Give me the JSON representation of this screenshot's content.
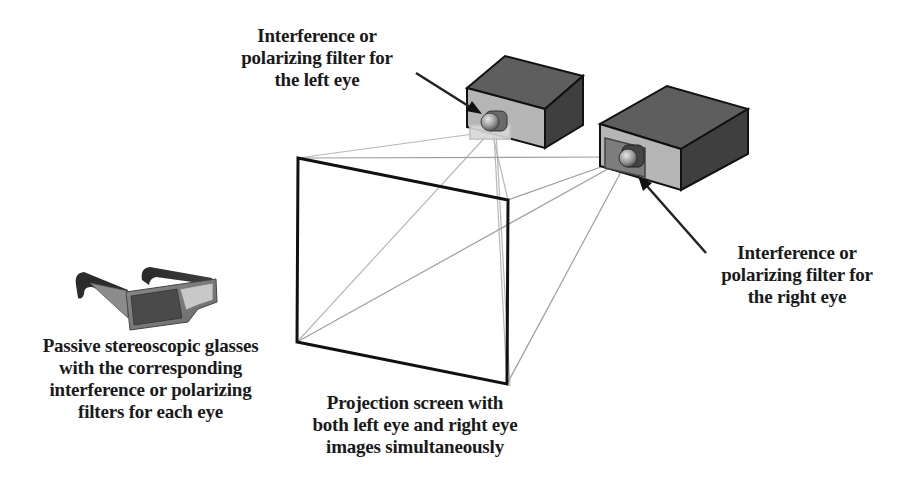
{
  "diagram": {
    "labels": {
      "left_filter": [
        "Interference or",
        "polarizing filter for",
        "the left eye"
      ],
      "right_filter": [
        "Interference or",
        "polarizing filter for",
        "the right eye"
      ],
      "glasses": [
        "Passive stereoscopic glasses",
        "with the corresponding",
        "interference or polarizing",
        "filters for each eye"
      ],
      "screen": [
        "Projection screen with",
        "both left eye and right eye",
        "images simultaneously"
      ]
    },
    "components": [
      {
        "id": "left-projector",
        "kind": "projector",
        "filter": "left-eye filter (light)"
      },
      {
        "id": "right-projector",
        "kind": "projector",
        "filter": "right-eye filter (dark)"
      },
      {
        "id": "projection-screen",
        "kind": "screen"
      },
      {
        "id": "stereo-glasses",
        "kind": "glasses",
        "lenses": [
          "dark (left)",
          "light (right)"
        ]
      }
    ],
    "colors": {
      "text": "#1a1a1a",
      "projector_top": "#5e5e5e",
      "projector_side": "#3f3f3f",
      "projector_front": "#b5b5b5",
      "left_filter": "#d6d6d6",
      "right_filter": "#7d7d7d",
      "beam_lines": "#b0b0b0",
      "screen_border": "#111111"
    }
  }
}
